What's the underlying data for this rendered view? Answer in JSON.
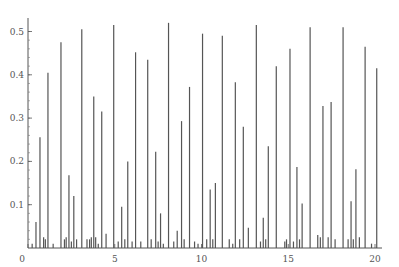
{
  "chart_data": {
    "type": "bar",
    "subtype": "spike",
    "title": "",
    "xlabel": "",
    "ylabel": "",
    "xlim": [
      0,
      20.3
    ],
    "ylim": [
      0,
      0.53
    ],
    "grid": false,
    "legend": null,
    "x_ticks": [
      0,
      5,
      10,
      15,
      20
    ],
    "x_tick_labels": [
      "0",
      "5",
      "10",
      "15",
      "20"
    ],
    "y_ticks": [
      0.1,
      0.2,
      0.3,
      0.4,
      0.5
    ],
    "y_tick_labels": [
      "0.1",
      "0.2",
      "0.3",
      "0.4",
      "0.5"
    ],
    "line_color": "#555555",
    "series": [
      {
        "name": "spikes",
        "x": [
          0.24,
          0.46,
          0.69,
          0.9,
          1.0,
          1.15,
          1.45,
          1.9,
          2.1,
          2.2,
          2.36,
          2.5,
          2.64,
          2.8,
          3.1,
          3.4,
          3.55,
          3.65,
          3.79,
          3.9,
          4.05,
          4.25,
          4.5,
          4.94,
          5.2,
          5.4,
          5.58,
          5.75,
          6.0,
          6.2,
          6.5,
          6.9,
          7.1,
          7.36,
          7.5,
          7.64,
          7.8,
          8.1,
          8.4,
          8.6,
          8.85,
          9.0,
          9.31,
          9.6,
          9.8,
          10.06,
          10.3,
          10.5,
          10.65,
          10.8,
          11.2,
          11.6,
          11.8,
          11.95,
          12.2,
          12.41,
          12.7,
          13.16,
          13.4,
          13.56,
          13.7,
          13.85,
          14.31,
          14.8,
          14.9,
          15.1,
          15.3,
          15.5,
          15.65,
          15.8,
          16.26,
          16.7,
          16.85,
          17.0,
          17.3,
          17.47,
          17.7,
          18.16,
          18.45,
          18.62,
          18.75,
          18.9,
          19.1,
          19.43,
          19.8,
          20.1
        ],
        "values": [
          0.01,
          0.06,
          0.256,
          0.025,
          0.02,
          0.405,
          0.01,
          0.475,
          0.02,
          0.025,
          0.168,
          0.015,
          0.12,
          0.02,
          0.505,
          0.02,
          0.02,
          0.025,
          0.35,
          0.025,
          0.01,
          0.315,
          0.033,
          0.515,
          0.015,
          0.095,
          0.02,
          0.2,
          0.015,
          0.452,
          0.015,
          0.435,
          0.02,
          0.222,
          0.015,
          0.08,
          0.01,
          0.52,
          0.015,
          0.04,
          0.293,
          0.02,
          0.372,
          0.015,
          0.01,
          0.495,
          0.02,
          0.135,
          0.02,
          0.15,
          0.49,
          0.02,
          0.01,
          0.383,
          0.02,
          0.28,
          0.047,
          0.515,
          0.015,
          0.07,
          0.02,
          0.235,
          0.42,
          0.015,
          0.02,
          0.46,
          0.015,
          0.187,
          0.02,
          0.103,
          0.51,
          0.03,
          0.025,
          0.328,
          0.025,
          0.337,
          0.02,
          0.51,
          0.02,
          0.108,
          0.02,
          0.182,
          0.025,
          0.465,
          0.01,
          0.415
        ]
      }
    ]
  }
}
